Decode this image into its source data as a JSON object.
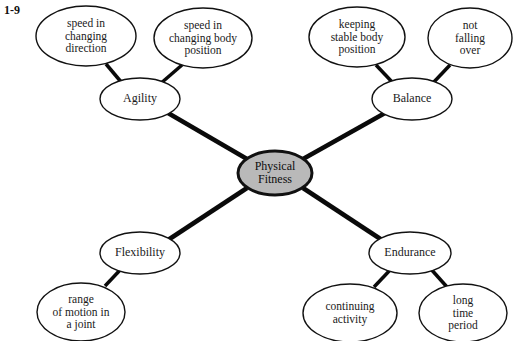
{
  "figure": {
    "label": "1-9"
  },
  "diagram": {
    "type": "concept-map",
    "center": {
      "id": "physical-fitness",
      "text": "Physical\nFitness",
      "line1": "Physical",
      "line2": "Fitness",
      "fill": "#b9b9b9",
      "stroke": "#000000",
      "cx": 275,
      "cy": 173,
      "rx": 37,
      "ry": 22
    },
    "branches": [
      {
        "id": "agility",
        "label": "Agility",
        "cx": 140,
        "cy": 99,
        "rx": 40,
        "ry": 21,
        "fill": "#ffffff",
        "stroke": "#000000",
        "leaves": [
          {
            "id": "speed-in-changing-direction",
            "lines": [
              "speed in",
              "changing",
              "direction"
            ],
            "cx": 86,
            "cy": 36,
            "rx": 50,
            "ry": 30
          },
          {
            "id": "speed-in-changing-body-position",
            "lines": [
              "speed in",
              "changing body",
              "position"
            ],
            "cx": 203,
            "cy": 38,
            "rx": 49,
            "ry": 30
          }
        ]
      },
      {
        "id": "balance",
        "label": "Balance",
        "cx": 412,
        "cy": 99,
        "rx": 40,
        "ry": 21,
        "fill": "#ffffff",
        "stroke": "#000000",
        "leaves": [
          {
            "id": "keeping-stable-body-position",
            "lines": [
              "keeping",
              "stable body",
              "position"
            ],
            "cx": 357,
            "cy": 37,
            "rx": 48,
            "ry": 30
          },
          {
            "id": "not-falling-over",
            "lines": [
              "not",
              "falling",
              "over"
            ],
            "cx": 470,
            "cy": 38,
            "rx": 42,
            "ry": 30
          }
        ]
      },
      {
        "id": "flexibility",
        "label": "Flexibility",
        "cx": 140,
        "cy": 253,
        "rx": 40,
        "ry": 21,
        "fill": "#ffffff",
        "stroke": "#000000",
        "leaves": [
          {
            "id": "range-of-motion-in-a-joint",
            "lines": [
              "range",
              "of motion in",
              "a joint"
            ],
            "cx": 81,
            "cy": 312,
            "rx": 44,
            "ry": 29
          }
        ]
      },
      {
        "id": "endurance",
        "label": "Endurance",
        "cx": 410,
        "cy": 253,
        "rx": 41,
        "ry": 21,
        "fill": "#ffffff",
        "stroke": "#000000",
        "leaves": [
          {
            "id": "continuing-activity",
            "lines": [
              "continuing",
              "activity"
            ],
            "cx": 350,
            "cy": 313,
            "rx": 47,
            "ry": 29
          },
          {
            "id": "long-time-period",
            "lines": [
              "long",
              "time",
              "period"
            ],
            "cx": 463,
            "cy": 313,
            "rx": 44,
            "ry": 29
          }
        ]
      }
    ],
    "edges": [
      {
        "id": "edge-center-agility",
        "from": "physical-fitness",
        "to": "agility",
        "x1": 247,
        "y1": 159,
        "x2": 168,
        "y2": 113
      },
      {
        "id": "edge-center-balance",
        "from": "physical-fitness",
        "to": "balance",
        "x1": 303,
        "y1": 159,
        "x2": 385,
        "y2": 113
      },
      {
        "id": "edge-center-flexibility",
        "from": "physical-fitness",
        "to": "flexibility",
        "x1": 247,
        "y1": 188,
        "x2": 168,
        "y2": 240
      },
      {
        "id": "edge-center-endurance",
        "from": "physical-fitness",
        "to": "endurance",
        "x1": 303,
        "y1": 188,
        "x2": 382,
        "y2": 240
      },
      {
        "id": "edge-agility-speed-direction",
        "x1": 122,
        "y1": 83,
        "x2": 106,
        "y2": 64
      },
      {
        "id": "edge-agility-speed-body",
        "x1": 160,
        "y1": 84,
        "x2": 182,
        "y2": 65
      },
      {
        "id": "edge-balance-keeping-stable",
        "x1": 394,
        "y1": 84,
        "x2": 376,
        "y2": 65
      },
      {
        "id": "edge-balance-not-falling",
        "x1": 432,
        "y1": 84,
        "x2": 450,
        "y2": 65
      },
      {
        "id": "edge-flexibility-range-motion",
        "x1": 122,
        "y1": 268,
        "x2": 105,
        "y2": 286
      },
      {
        "id": "edge-endurance-continuing",
        "x1": 392,
        "y1": 268,
        "x2": 374,
        "y2": 287
      },
      {
        "id": "edge-endurance-long-time",
        "x1": 430,
        "y1": 268,
        "x2": 447,
        "y2": 287
      }
    ],
    "style": {
      "ellipse_stroke": "#111111",
      "ellipse_stroke_width": 1.4,
      "center_stroke_width": 3,
      "edge_color": "#0a0a0a",
      "edge_width_main": 4.5,
      "edge_width_leaf": 3.5,
      "background": "#ffffff"
    }
  }
}
